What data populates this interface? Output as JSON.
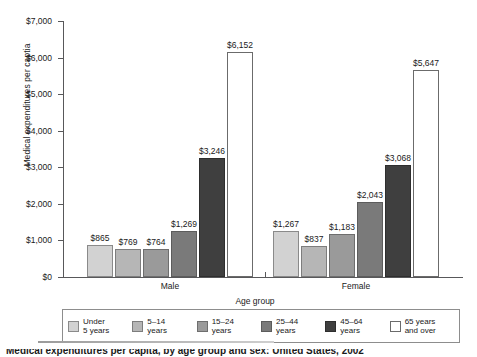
{
  "chart_data": {
    "type": "bar",
    "title": "",
    "xlabel": "Age group",
    "ylabel": "Medical expenditures per captia",
    "ylim": [
      0,
      7000
    ],
    "ytick_labels": [
      "$7,000",
      "$6,000",
      "$5,000",
      "$4,000",
      "$3,000",
      "$2,000",
      "$1,000",
      "$0"
    ],
    "ytick_values": [
      7000,
      6000,
      5000,
      4000,
      3000,
      2000,
      1000,
      0
    ],
    "grid": false,
    "legend_position": "bottom",
    "categories": [
      "Male",
      "Female"
    ],
    "series": [
      {
        "name": "Under 5 years",
        "swatch": "c0",
        "color": "#d2d2d2",
        "values": [
          865,
          1267
        ],
        "labels": [
          "$865",
          "$1,267"
        ]
      },
      {
        "name": "5–14 years",
        "swatch": "c1",
        "color": "#b6b6b6",
        "values": [
          769,
          837
        ],
        "labels": [
          "$769",
          "$837"
        ]
      },
      {
        "name": "15–24 years",
        "swatch": "c2",
        "color": "#9a9a9a",
        "values": [
          764,
          1183
        ],
        "labels": [
          "$764",
          "$1,183"
        ]
      },
      {
        "name": "25–44 years",
        "swatch": "c3",
        "color": "#7a7a7a",
        "values": [
          1269,
          2043
        ],
        "labels": [
          "$1,269",
          "$2,043"
        ]
      },
      {
        "name": "45–64 years",
        "swatch": "c4",
        "color": "#3f3f3f",
        "values": [
          3246,
          3068
        ],
        "labels": [
          "$3,246",
          "$3,068"
        ]
      },
      {
        "name": "65 years and over",
        "swatch": "c5",
        "color": "#ffffff",
        "values": [
          6152,
          5647
        ],
        "labels": [
          "$6,152",
          "$5,647"
        ]
      }
    ]
  },
  "legend": {
    "title": "Age group",
    "entries": [
      {
        "label": "Under\n5 years",
        "swatch": "c0"
      },
      {
        "label": "5–14\nyears",
        "swatch": "c1"
      },
      {
        "label": "15–24\nyears",
        "swatch": "c2"
      },
      {
        "label": "25–44\nyears",
        "swatch": "c3"
      },
      {
        "label": "45–64\nyears",
        "swatch": "c4"
      },
      {
        "label": "65 years\nand over",
        "swatch": "c5"
      }
    ]
  },
  "caption": {
    "text": "Medical expenditures per capita, by age group and sex: United States, 2002"
  }
}
